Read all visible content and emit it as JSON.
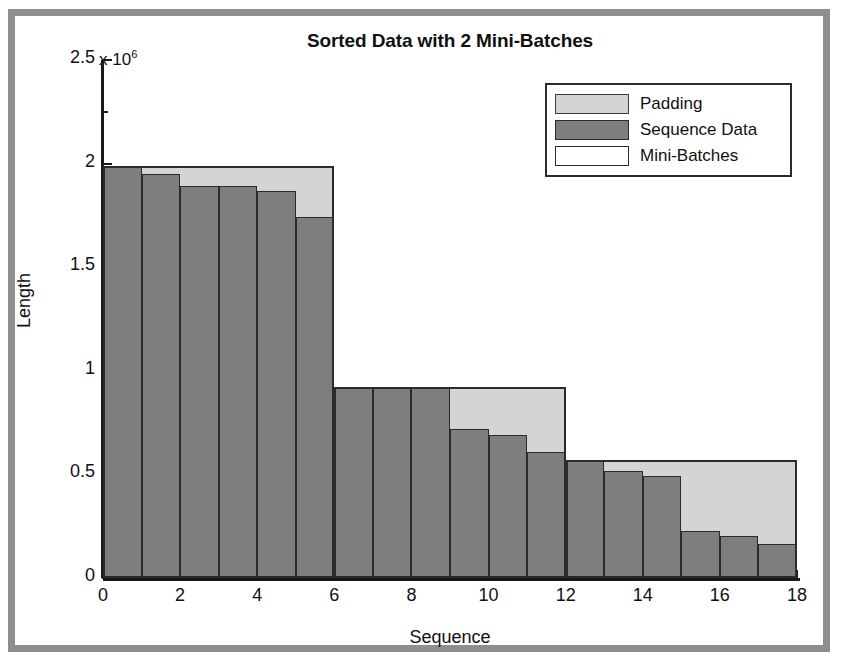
{
  "chart_data": {
    "type": "bar",
    "title": "Sorted Data with 2 Mini-Batches",
    "xlabel": "Sequence",
    "ylabel": "Length",
    "y_exponent_label": "x 10",
    "y_exponent_power": "6",
    "y_scale_factor": 1000000,
    "xlim": [
      0,
      18
    ],
    "ylim": [
      0,
      2500000
    ],
    "ytick_labels": [
      "0",
      "0.5",
      "1",
      "1.5",
      "2",
      "2.5"
    ],
    "ytick_values": [
      0,
      500000,
      1000000,
      1500000,
      2000000,
      2500000
    ],
    "xtick_labels": [
      "0",
      "2",
      "4",
      "6",
      "8",
      "10",
      "12",
      "14",
      "16",
      "18"
    ],
    "xtick_values": [
      0,
      2,
      4,
      6,
      8,
      10,
      12,
      14,
      16,
      18
    ],
    "grid": false,
    "legend_position": "top-right",
    "legend_entries": [
      {
        "label": "Padding",
        "color": "#d4d4d4",
        "swatch": "filled"
      },
      {
        "label": "Sequence Data",
        "color": "#7e7e7e",
        "swatch": "filled"
      },
      {
        "label": "Mini-Batches",
        "color": "#ffffff",
        "swatch": "outline"
      }
    ],
    "categories": [
      1,
      2,
      3,
      4,
      5,
      6,
      7,
      8,
      9,
      10,
      11,
      12,
      13,
      14,
      15,
      16,
      17,
      18
    ],
    "series": [
      {
        "name": "Sequence Data",
        "color": "#7e7e7e",
        "values": [
          1990000,
          1950000,
          1890000,
          1890000,
          1870000,
          1740000,
          920000,
          920000,
          920000,
          720000,
          690000,
          610000,
          570000,
          515000,
          490000,
          225000,
          205000,
          165000
        ]
      },
      {
        "name": "Padding",
        "color": "#d4d4d4",
        "values": [
          0,
          40000,
          100000,
          100000,
          120000,
          250000,
          0,
          0,
          0,
          200000,
          230000,
          310000,
          0,
          55000,
          80000,
          345000,
          365000,
          405000
        ]
      }
    ],
    "mini_batches": [
      {
        "index": 1,
        "x_start": 0,
        "x_end": 6,
        "padded_length": 1990000
      },
      {
        "index": 2,
        "x_start": 6,
        "x_end": 12,
        "padded_length": 920000
      },
      {
        "index": 3,
        "x_start": 12,
        "x_end": 18,
        "padded_length": 570000
      }
    ],
    "num_mini_batches_in_title": 2
  }
}
